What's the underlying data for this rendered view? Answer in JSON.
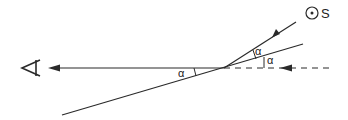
{
  "diagram": {
    "type": "optics-reflection",
    "source_label": "S",
    "angle_label": "α",
    "angle_labels": [
      "α",
      "α",
      "α"
    ],
    "elements": {
      "observer": "eye-icon",
      "source": "point-source-icon",
      "mirror": "inclined-line",
      "incident_ray": "ray-with-arrow",
      "reflected_ray": "horizontal-ray-to-eye",
      "dashed_line": "horizontal-dashed-reference"
    },
    "colors": {
      "line": "#2a2a2a",
      "background": "#ffffff"
    }
  }
}
